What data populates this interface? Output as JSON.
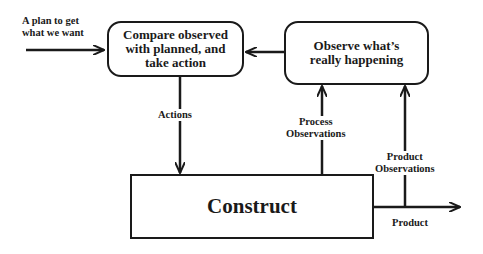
{
  "nodes": {
    "compare": {
      "label": "Compare observed with planned, and take action"
    },
    "observe": {
      "label": "Observe what’s really happening"
    },
    "construct": {
      "label": "Construct"
    }
  },
  "edges": {
    "plan": {
      "label_line1": "A plan to get",
      "label_line2": "what we want"
    },
    "actions": {
      "label": "Actions"
    },
    "process_obs": {
      "label_line1": "Process",
      "label_line2": "Observations"
    },
    "product_obs": {
      "label_line1": "Product",
      "label_line2": "Observations"
    },
    "product": {
      "label": "Product"
    }
  },
  "colors": {
    "stroke": "#1a1a1a",
    "background": "#ffffff"
  }
}
